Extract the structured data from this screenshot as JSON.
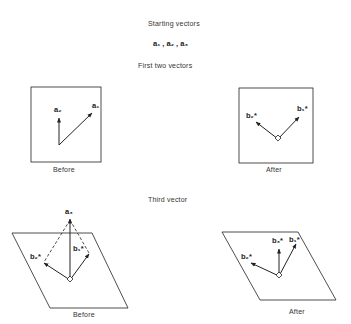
{
  "sections": {
    "starting": {
      "title": "Starting vectors",
      "vectors_label": "a₁ , a₂ , a₃"
    },
    "first_two": {
      "title": "First two vectors",
      "before_label": "Before",
      "after_label": "After"
    },
    "third": {
      "title": "Third vector",
      "before_label": "Before",
      "after_label": "After"
    }
  },
  "labels": {
    "a1": "a₁",
    "a2": "a₂",
    "a3": "a₃",
    "b1": "b₁*",
    "b2": "b₂*",
    "b3": "b₃*"
  },
  "colors": {
    "stroke": "#222222",
    "background": "#ffffff"
  }
}
